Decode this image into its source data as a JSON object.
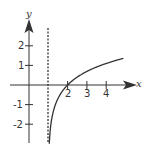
{
  "chart_data": {
    "type": "line",
    "title": "",
    "xlabel": "x",
    "ylabel": "y",
    "function": "y = ln(x - 1)",
    "asymptote": {
      "type": "vertical",
      "x": 1,
      "style": "dashed"
    },
    "x_intercept": [
      2,
      0
    ],
    "xlim": [
      -1.5,
      5.4
    ],
    "ylim": [
      -3,
      3.2
    ],
    "x_ticks": [
      2,
      3,
      4
    ],
    "x_tick_labels": [
      "2",
      "3",
      "4"
    ],
    "y_ticks": [
      2,
      1,
      -1,
      -2
    ],
    "y_tick_labels": [
      "2",
      "1",
      "-1",
      "-2"
    ],
    "series": [
      {
        "name": "curve",
        "x": [
          1.05,
          1.1,
          1.2,
          1.4,
          1.6,
          2.0,
          2.5,
          3.0,
          3.5,
          4.0,
          4.5,
          4.9
        ],
        "y": [
          -3.0,
          -2.3,
          -1.61,
          -0.92,
          -0.51,
          0.0,
          0.41,
          0.69,
          0.92,
          1.1,
          1.25,
          1.36
        ]
      }
    ],
    "grid": false,
    "legend": null
  },
  "labels": {
    "x_axis": "x",
    "y_axis": "y",
    "x_ticks": [
      "2",
      "3",
      "4"
    ],
    "y_ticks": [
      "2",
      "1",
      "-1",
      "-2"
    ]
  }
}
